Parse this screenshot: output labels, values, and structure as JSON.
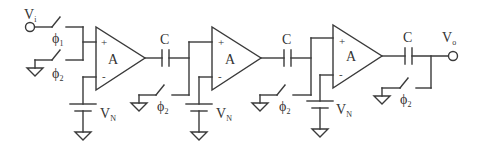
{
  "diagram": {
    "type": "circuit-schematic",
    "colors": {
      "line": "#3a3a3a",
      "text": "#333333",
      "background": "#ffffff"
    },
    "input": {
      "label": "V",
      "sub": "i"
    },
    "output": {
      "label": "V",
      "sub": "o"
    },
    "switches": [
      {
        "id": "s_in_phi1",
        "label": "ϕ",
        "sub": "1"
      },
      {
        "id": "s_gnd_phi2_1",
        "label": "ϕ",
        "sub": "2"
      },
      {
        "id": "s_stage2_phi2",
        "label": "ϕ",
        "sub": "2"
      },
      {
        "id": "s_stage3_phi2",
        "label": "ϕ",
        "sub": "2"
      },
      {
        "id": "s_out_phi2",
        "label": "ϕ",
        "sub": "2"
      }
    ],
    "amplifiers": [
      {
        "label": "A",
        "plus": "+",
        "minus": "-"
      },
      {
        "label": "A",
        "plus": "+",
        "minus": "-"
      },
      {
        "label": "A",
        "plus": "+",
        "minus": "-"
      }
    ],
    "capacitors": [
      {
        "label": "C"
      },
      {
        "label": "C"
      },
      {
        "label": "C"
      }
    ],
    "sources": [
      {
        "label": "V",
        "sub": "N"
      },
      {
        "label": "V",
        "sub": "N"
      },
      {
        "label": "V",
        "sub": "N"
      }
    ]
  }
}
